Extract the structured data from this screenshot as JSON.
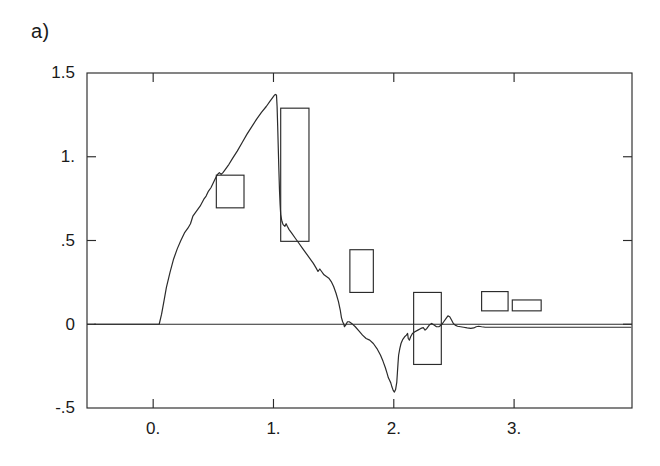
{
  "figure": {
    "panel_label": "a)",
    "background": "#ffffff",
    "ink_color": "#2b2b2b"
  },
  "chart_data": {
    "type": "line",
    "title": "",
    "subtitle": "",
    "xlabel": "",
    "ylabel": "",
    "xlim": [
      -0.55,
      3.98
    ],
    "ylim": [
      -0.5,
      1.5
    ],
    "grid": false,
    "legend": null,
    "x_ticks": [
      {
        "value": 0,
        "label": "0."
      },
      {
        "value": 1,
        "label": "1."
      },
      {
        "value": 2,
        "label": "2."
      },
      {
        "value": 3,
        "label": "3."
      }
    ],
    "y_ticks": [
      {
        "value": -0.5,
        "label": "-.5"
      },
      {
        "value": 0,
        "label": "0"
      },
      {
        "value": 0.5,
        "label": ".5"
      },
      {
        "value": 1.0,
        "label": "1."
      },
      {
        "value": 1.5,
        "label": "1.5"
      }
    ],
    "series": [
      {
        "name": "signal",
        "points": [
          [
            -0.49,
            0.0
          ],
          [
            -0.3,
            0.0
          ],
          [
            -0.1,
            0.0
          ],
          [
            0.03,
            0.0
          ],
          [
            0.05,
            0.0
          ],
          [
            0.07,
            0.06
          ],
          [
            0.09,
            0.14
          ],
          [
            0.11,
            0.22
          ],
          [
            0.14,
            0.31
          ],
          [
            0.17,
            0.39
          ],
          [
            0.2,
            0.45
          ],
          [
            0.23,
            0.5
          ],
          [
            0.26,
            0.545
          ],
          [
            0.29,
            0.575
          ],
          [
            0.31,
            0.6
          ],
          [
            0.33,
            0.645
          ],
          [
            0.36,
            0.675
          ],
          [
            0.39,
            0.705
          ],
          [
            0.42,
            0.745
          ],
          [
            0.44,
            0.765
          ],
          [
            0.46,
            0.795
          ],
          [
            0.48,
            0.815
          ],
          [
            0.5,
            0.845
          ],
          [
            0.52,
            0.875
          ],
          [
            0.535,
            0.895
          ],
          [
            0.55,
            0.905
          ],
          [
            0.565,
            0.895
          ],
          [
            0.58,
            0.905
          ],
          [
            0.6,
            0.925
          ],
          [
            0.63,
            0.955
          ],
          [
            0.66,
            0.99
          ],
          [
            0.7,
            1.035
          ],
          [
            0.74,
            1.085
          ],
          [
            0.78,
            1.135
          ],
          [
            0.82,
            1.18
          ],
          [
            0.86,
            1.225
          ],
          [
            0.9,
            1.265
          ],
          [
            0.94,
            1.3
          ],
          [
            0.97,
            1.33
          ],
          [
            0.99,
            1.35
          ],
          [
            1.005,
            1.365
          ],
          [
            1.015,
            1.372
          ],
          [
            1.025,
            1.368
          ],
          [
            1.03,
            1.3
          ],
          [
            1.035,
            1.18
          ],
          [
            1.04,
            1.05
          ],
          [
            1.045,
            0.92
          ],
          [
            1.05,
            0.8
          ],
          [
            1.055,
            0.715
          ],
          [
            1.06,
            0.655
          ],
          [
            1.07,
            0.615
          ],
          [
            1.08,
            0.595
          ],
          [
            1.095,
            0.585
          ],
          [
            1.105,
            0.6
          ],
          [
            1.115,
            0.585
          ],
          [
            1.13,
            0.565
          ],
          [
            1.15,
            0.545
          ],
          [
            1.18,
            0.515
          ],
          [
            1.21,
            0.485
          ],
          [
            1.24,
            0.455
          ],
          [
            1.27,
            0.425
          ],
          [
            1.3,
            0.395
          ],
          [
            1.33,
            0.365
          ],
          [
            1.355,
            0.335
          ],
          [
            1.37,
            0.315
          ],
          [
            1.385,
            0.33
          ],
          [
            1.4,
            0.315
          ],
          [
            1.42,
            0.295
          ],
          [
            1.44,
            0.285
          ],
          [
            1.46,
            0.275
          ],
          [
            1.48,
            0.255
          ],
          [
            1.5,
            0.225
          ],
          [
            1.52,
            0.185
          ],
          [
            1.54,
            0.135
          ],
          [
            1.555,
            0.085
          ],
          [
            1.565,
            0.04
          ],
          [
            1.575,
            0.015
          ],
          [
            1.585,
            0.0
          ],
          [
            1.59,
            -0.015
          ],
          [
            1.6,
            -0.005
          ],
          [
            1.615,
            0.015
          ],
          [
            1.63,
            0.015
          ],
          [
            1.65,
            0.005
          ],
          [
            1.68,
            -0.015
          ],
          [
            1.71,
            -0.04
          ],
          [
            1.74,
            -0.065
          ],
          [
            1.77,
            -0.085
          ],
          [
            1.8,
            -0.095
          ],
          [
            1.83,
            -0.115
          ],
          [
            1.86,
            -0.145
          ],
          [
            1.89,
            -0.185
          ],
          [
            1.91,
            -0.22
          ],
          [
            1.93,
            -0.26
          ],
          [
            1.945,
            -0.295
          ],
          [
            1.955,
            -0.32
          ],
          [
            1.965,
            -0.335
          ],
          [
            1.975,
            -0.35
          ],
          [
            1.985,
            -0.375
          ],
          [
            1.995,
            -0.395
          ],
          [
            2.005,
            -0.405
          ],
          [
            2.015,
            -0.39
          ],
          [
            2.025,
            -0.345
          ],
          [
            2.03,
            -0.29
          ],
          [
            2.035,
            -0.235
          ],
          [
            2.04,
            -0.185
          ],
          [
            2.05,
            -0.145
          ],
          [
            2.06,
            -0.115
          ],
          [
            2.075,
            -0.09
          ],
          [
            2.09,
            -0.075
          ],
          [
            2.105,
            -0.065
          ],
          [
            2.115,
            -0.055
          ],
          [
            2.12,
            -0.085
          ],
          [
            2.13,
            -0.095
          ],
          [
            2.14,
            -0.075
          ],
          [
            2.155,
            -0.055
          ],
          [
            2.175,
            -0.045
          ],
          [
            2.2,
            -0.035
          ],
          [
            2.225,
            -0.025
          ],
          [
            2.245,
            -0.02
          ],
          [
            2.26,
            -0.035
          ],
          [
            2.275,
            -0.025
          ],
          [
            2.295,
            -0.005
          ],
          [
            2.315,
            0.005
          ],
          [
            2.335,
            -0.005
          ],
          [
            2.355,
            -0.015
          ],
          [
            2.375,
            -0.015
          ],
          [
            2.395,
            -0.005
          ],
          [
            2.415,
            0.015
          ],
          [
            2.435,
            0.035
          ],
          [
            2.45,
            0.05
          ],
          [
            2.465,
            0.045
          ],
          [
            2.48,
            0.025
          ],
          [
            2.495,
            0.005
          ],
          [
            2.51,
            -0.005
          ],
          [
            2.53,
            -0.012
          ],
          [
            2.555,
            -0.015
          ],
          [
            2.58,
            -0.018
          ],
          [
            2.61,
            -0.022
          ],
          [
            2.64,
            -0.025
          ],
          [
            2.665,
            -0.022
          ],
          [
            2.685,
            -0.015
          ],
          [
            2.705,
            -0.012
          ],
          [
            2.73,
            -0.015
          ],
          [
            2.76,
            -0.018
          ],
          [
            2.79,
            -0.018
          ],
          [
            2.83,
            -0.018
          ],
          [
            2.9,
            -0.018
          ],
          [
            3.0,
            -0.018
          ],
          [
            3.2,
            -0.018
          ],
          [
            3.5,
            -0.018
          ],
          [
            3.8,
            -0.018
          ],
          [
            3.97,
            -0.018
          ]
        ]
      }
    ],
    "annotation_boxes": [
      {
        "name": "box-at-0p5",
        "x0": 0.525,
        "x1": 0.755,
        "y0": 0.695,
        "y1": 0.89
      },
      {
        "name": "box-at-1p0",
        "x0": 1.06,
        "x1": 1.295,
        "y0": 0.495,
        "y1": 1.29
      },
      {
        "name": "box-at-1p5",
        "x0": 1.635,
        "x1": 1.83,
        "y0": 0.19,
        "y1": 0.445
      },
      {
        "name": "box-at-2p0",
        "x0": 2.165,
        "x1": 2.395,
        "y0": -0.24,
        "y1": 0.19
      },
      {
        "name": "box-at-2p45",
        "x0": 2.73,
        "x1": 2.95,
        "y0": 0.08,
        "y1": 0.195
      },
      {
        "name": "box-at-2p7",
        "x0": 2.985,
        "x1": 3.225,
        "y0": 0.08,
        "y1": 0.145
      }
    ]
  }
}
